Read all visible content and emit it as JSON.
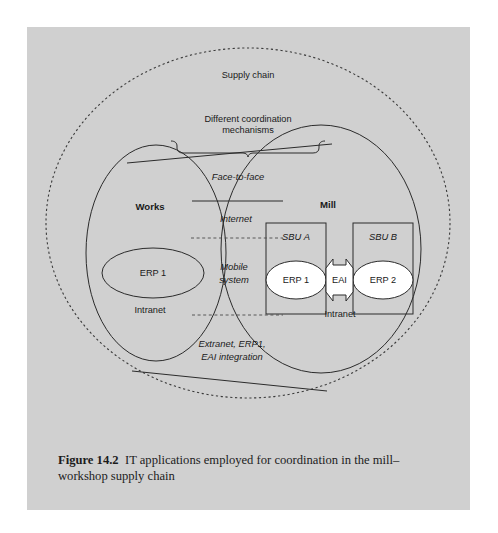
{
  "figure": {
    "number_label": "Figure 14.2",
    "caption_text": "IT applications employed for coordination in the mill–workshop supply chain"
  },
  "diagram": {
    "type": "venn-overlap-system-diagram",
    "outer_boundary": {
      "name": "supply-chain",
      "label": "Supply chain",
      "style": "dashed-circle"
    },
    "annotation": {
      "bracket_label_line1": "Different coordination",
      "bracket_label_line2": "mechanisms",
      "bracket_style": "curly-brace-below-text"
    },
    "left_entity": {
      "name": "works",
      "label": "Works",
      "inner_system": "ERP 1",
      "network_label": "Intranet"
    },
    "right_entity": {
      "name": "mill",
      "label": "Mill",
      "network_label": "Intranet",
      "units": [
        {
          "label": "SBU A",
          "system": "ERP 1"
        },
        {
          "label": "SBU B",
          "system": "ERP 2"
        }
      ],
      "integration_middleware": "EAI"
    },
    "overlap_mechanisms": [
      {
        "label": "Face-to-face",
        "divider_below": "solid"
      },
      {
        "label": "Internet",
        "divider_below": "dashed"
      },
      {
        "label_line1": "Mobile",
        "label_line2": "system",
        "divider_below": "dashed"
      },
      {
        "label_line1": "Extranet, ERP1,",
        "label_line2": "EAI integration",
        "divider_below": "none"
      }
    ],
    "colors": {
      "panel_background": "#d0d0d0",
      "page_background": "#ffffff",
      "line": "#2b2b2b",
      "ellipse_fill_white": "#ffffff",
      "text": "#1a1a1a"
    }
  }
}
